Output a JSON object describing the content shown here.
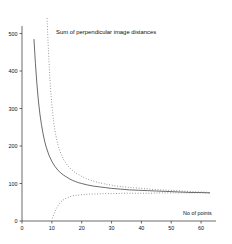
{
  "chart_data": {
    "type": "line",
    "title": "Sum of perpendicular image distances",
    "xlabel": "No of points",
    "ylabel": "",
    "xlim": [
      0,
      65
    ],
    "ylim": [
      0,
      520
    ],
    "grid": false,
    "legend_position": "none",
    "xticks": [
      0,
      10,
      20,
      30,
      40,
      50,
      60
    ],
    "yticks": [
      0,
      100,
      200,
      300,
      400,
      500
    ],
    "series": [
      {
        "name": "solid-curve",
        "style": "solid",
        "color": "#3a3a3a",
        "x": [
          4,
          4.5,
          5,
          5.5,
          6,
          6.5,
          7,
          7.5,
          8,
          9,
          10,
          11,
          12,
          13,
          14,
          15,
          16,
          17,
          18,
          19,
          20,
          22,
          24,
          26,
          28,
          30,
          33,
          36,
          39,
          42,
          45,
          48,
          51,
          54,
          57,
          60,
          63
        ],
        "y": [
          485,
          420,
          365,
          320,
          285,
          258,
          235,
          216,
          200,
          176,
          159,
          146,
          136,
          128,
          122,
          117,
          112,
          108,
          105,
          102,
          100,
          96,
          93,
          91,
          89,
          87,
          85,
          83,
          82,
          81,
          80,
          79,
          78,
          77,
          76,
          76,
          75
        ]
      },
      {
        "name": "upper-dotted-curve",
        "style": "dotted",
        "color": "#7a7a7a",
        "x": [
          8.4,
          8.6,
          8.9,
          9.2,
          9.6,
          10,
          10.5,
          11,
          11.6,
          12.2,
          13,
          13.8,
          14.6,
          15.5,
          16.5,
          17.5,
          18.5,
          20,
          21.5,
          23,
          25,
          27,
          29,
          31,
          34,
          37,
          40,
          43,
          46,
          49,
          52,
          55,
          58,
          61,
          63
        ],
        "y": [
          540,
          500,
          450,
          400,
          350,
          310,
          272,
          243,
          218,
          198,
          180,
          166,
          155,
          146,
          138,
          131,
          126,
          119,
          113,
          109,
          104,
          100,
          97,
          94,
          91,
          89,
          87,
          85,
          83,
          82,
          81,
          79,
          78,
          77,
          76
        ]
      },
      {
        "name": "lower-dotted-curve",
        "style": "dotted",
        "color": "#7a7a7a",
        "x": [
          10.2,
          10.5,
          10.9,
          11.3,
          11.8,
          12.4,
          13,
          13.8,
          14.6,
          15.5,
          16.5,
          17.6,
          18.8,
          20,
          21.5,
          23,
          25,
          27,
          29,
          31,
          34,
          37,
          40,
          43,
          46,
          49,
          52,
          55,
          58,
          61,
          63
        ],
        "y": [
          8,
          14,
          22,
          30,
          38,
          45,
          51,
          56,
          60,
          63,
          66,
          68,
          69,
          70,
          71,
          72,
          72,
          73,
          73,
          73,
          74,
          74,
          74,
          74,
          75,
          75,
          75,
          75,
          75,
          75,
          75
        ]
      }
    ]
  }
}
